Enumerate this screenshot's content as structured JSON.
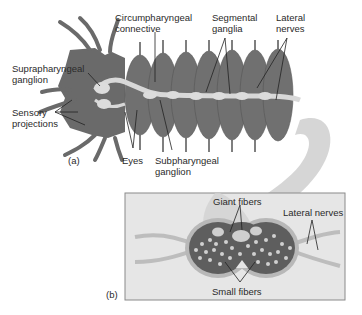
{
  "panel_a": {
    "tag": "(a)",
    "labels": {
      "circumpharyngeal": [
        "Circumpharyngeal",
        "connective"
      ],
      "segmental": [
        "Segmental",
        "ganglia"
      ],
      "lateral": [
        "Lateral",
        "nerves"
      ],
      "supra": [
        "Suprapharyngeal",
        "ganglion"
      ],
      "sensory": [
        "Sensory",
        "projections"
      ],
      "eyes": "Eyes",
      "sub": [
        "Subpharyngeal",
        "ganglion"
      ]
    }
  },
  "panel_b": {
    "tag": "(b)",
    "labels": {
      "giant": "Giant fibers",
      "lateral": "Lateral nerves",
      "small": "Small fibers"
    }
  },
  "colors": {
    "body": "#6b6b6b",
    "body_dark": "#4e4e4e",
    "nerve": "#d8d8d8",
    "box": "#e4e4e4",
    "cord_outer": "#b5b5b5",
    "cord_inner": "#5a5a5a"
  }
}
